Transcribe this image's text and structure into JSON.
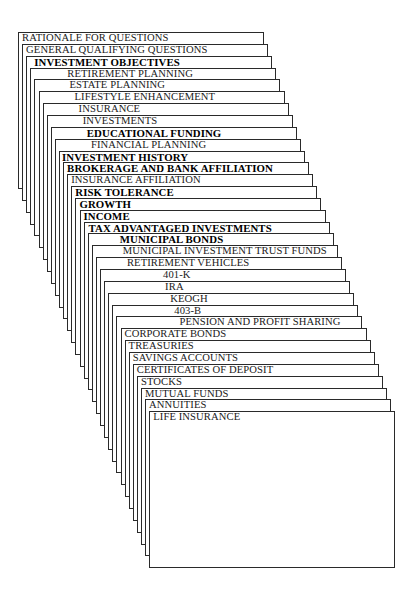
{
  "diagram": {
    "type": "stacked-index-cards",
    "card_count": 32,
    "cards": [
      {
        "label": "RATIONALE FOR QUESTIONS",
        "bold": false,
        "indent": 3
      },
      {
        "label": "GENERAL QUALIFYING QUESTIONS",
        "bold": false,
        "indent": 3
      },
      {
        "label": "INVESTMENT OBJECTIVES",
        "bold": true,
        "indent": 7
      },
      {
        "label": "RETIREMENT PLANNING",
        "bold": false,
        "indent": 36
      },
      {
        "label": "ESTATE PLANNING",
        "bold": false,
        "indent": 34
      },
      {
        "label": "LIFESTYLE ENHANCEMENT",
        "bold": false,
        "indent": 35
      },
      {
        "label": "INSURANCE",
        "bold": false,
        "indent": 35
      },
      {
        "label": "INVESTMENTS",
        "bold": false,
        "indent": 35
      },
      {
        "label": "EDUCATIONAL FUNDING",
        "bold": true,
        "indent": 35
      },
      {
        "label": "FINANCIAL PLANNING",
        "bold": false,
        "indent": 35
      },
      {
        "label": "INVESTMENT HISTORY",
        "bold": true,
        "indent": 2
      },
      {
        "label": "BROKERAGE AND BANK AFFILIATION",
        "bold": true,
        "indent": 3
      },
      {
        "label": "INSURANCE AFFILIATION",
        "bold": false,
        "indent": 3
      },
      {
        "label": "RISK TOLERANCE",
        "bold": true,
        "indent": 3
      },
      {
        "label": "GROWTH",
        "bold": true,
        "indent": 3
      },
      {
        "label": "INCOME",
        "bold": true,
        "indent": 3
      },
      {
        "label": "TAX ADVANTAGED INVESTMENTS",
        "bold": true,
        "indent": 4
      },
      {
        "label": "MUNICIPAL BONDS",
        "bold": true,
        "indent": 31
      },
      {
        "label": "MUNICIPAL INVESTMENT TRUST FUNDS",
        "bold": false,
        "indent": 30
      },
      {
        "label": "RETIREMENT VEHICLES",
        "bold": false,
        "indent": 30
      },
      {
        "label": "401-K",
        "bold": false,
        "indent": 62
      },
      {
        "label": "IRA",
        "bold": false,
        "indent": 60
      },
      {
        "label": "KEOGH",
        "bold": false,
        "indent": 61
      },
      {
        "label": "403-B",
        "bold": false,
        "indent": 61
      },
      {
        "label": "PENSION AND PROFIT SHARING",
        "bold": false,
        "indent": 62
      },
      {
        "label": "CORPORATE BONDS",
        "bold": false,
        "indent": 3
      },
      {
        "label": "TREASURIES",
        "bold": false,
        "indent": 3
      },
      {
        "label": "SAVINGS ACCOUNTS",
        "bold": false,
        "indent": 3
      },
      {
        "label": "CERTIFICATES OF DEPOSIT",
        "bold": false,
        "indent": 3
      },
      {
        "label": "STOCKS",
        "bold": false,
        "indent": 3
      },
      {
        "label": "MUTUAL FUNDS",
        "bold": false,
        "indent": 3
      },
      {
        "label": "ANNUITIES",
        "bold": false,
        "indent": 3
      },
      {
        "label": "LIFE INSURANCE",
        "bold": false,
        "indent": 3
      }
    ]
  }
}
